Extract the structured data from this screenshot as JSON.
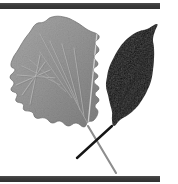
{
  "figure": {
    "kind": "natural-image",
    "width": 178,
    "height": 184,
    "background_color": "#ffffff",
    "caption": "Two leaves arranged with crossing petioles: a gray toothed ovate leaf on the left and a black leaf silhouette on the right, between dark horizontal rules."
  },
  "colors": {
    "background": "#ffffff",
    "rule": "#3b3b3b",
    "rule_highlight": "#565656",
    "gray_leaf_base": "#9a9a9a",
    "gray_leaf_shadow": "#7c7c7c",
    "gray_leaf_light": "#b4b4b4",
    "gray_leaf_vein": "#c9c9c9",
    "gray_leaf_edge": "#6d6d6d",
    "dark_leaf": "#080808",
    "dark_leaf_sheen": "#262626",
    "petiole_gray": "#8d8d8d",
    "petiole_dark": "#151515"
  },
  "rules": {
    "top": {
      "name": "top-rule",
      "x": 0,
      "y": 3,
      "width": 160,
      "height": 6
    },
    "bottom": {
      "name": "bottom-rule",
      "x": 0,
      "y": 176,
      "width": 160,
      "height": 6
    }
  },
  "specimens": [
    {
      "id": "gray-leaf",
      "label": "Gray toothed leaf",
      "position": "left",
      "tone": "mid gray",
      "margin": "serrate",
      "venation": "pinnate",
      "tip_point": [
        97,
        34
      ],
      "base_point": [
        88,
        126
      ],
      "petiole_end": [
        116,
        173
      ],
      "outline": [
        [
          97,
          34
        ],
        [
          88,
          30
        ],
        [
          76,
          22
        ],
        [
          64,
          17
        ],
        [
          52,
          17
        ],
        [
          44,
          22
        ],
        [
          36,
          24
        ],
        [
          30,
          32
        ],
        [
          24,
          40
        ],
        [
          18,
          50
        ],
        [
          13,
          58
        ],
        [
          11,
          66
        ],
        [
          15,
          70
        ],
        [
          10,
          77
        ],
        [
          14,
          83
        ],
        [
          11,
          90
        ],
        [
          17,
          94
        ],
        [
          16,
          101
        ],
        [
          23,
          104
        ],
        [
          24,
          110
        ],
        [
          32,
          112
        ],
        [
          36,
          118
        ],
        [
          45,
          118
        ],
        [
          52,
          123
        ],
        [
          60,
          121
        ],
        [
          68,
          126
        ],
        [
          76,
          123
        ],
        [
          84,
          127
        ],
        [
          88,
          122
        ],
        [
          94,
          120
        ],
        [
          98,
          112
        ],
        [
          95,
          106
        ],
        [
          99,
          100
        ],
        [
          95,
          94
        ],
        [
          99,
          88
        ],
        [
          94,
          82
        ],
        [
          98,
          76
        ],
        [
          93,
          70
        ],
        [
          98,
          64
        ],
        [
          94,
          57
        ],
        [
          99,
          50
        ],
        [
          95,
          43
        ],
        [
          99,
          38
        ]
      ],
      "veins": [
        [
          [
            88,
            124
          ],
          [
            40,
            34
          ]
        ],
        [
          [
            78,
            104
          ],
          [
            50,
            41
          ]
        ],
        [
          [
            72,
            98
          ],
          [
            40,
            52
          ]
        ],
        [
          [
            66,
            92
          ],
          [
            30,
            60
          ]
        ],
        [
          [
            60,
            85
          ],
          [
            22,
            66
          ]
        ],
        [
          [
            55,
            78
          ],
          [
            17,
            75
          ]
        ],
        [
          [
            50,
            70
          ],
          [
            16,
            85
          ]
        ],
        [
          [
            45,
            62
          ],
          [
            22,
            95
          ]
        ],
        [
          [
            40,
            55
          ],
          [
            30,
            104
          ]
        ],
        [
          [
            80,
            110
          ],
          [
            62,
            44
          ]
        ],
        [
          [
            84,
            116
          ],
          [
            74,
            48
          ]
        ]
      ]
    },
    {
      "id": "black-leaf",
      "label": "Black leaf silhouette",
      "position": "right",
      "tone": "near black",
      "margin": "entire",
      "venation": "pinnate, faint",
      "tip_point": [
        157,
        24
      ],
      "base_point": [
        112,
        126
      ],
      "petiole_end": [
        77,
        158
      ],
      "outline": [
        [
          157,
          24
        ],
        [
          147,
          29
        ],
        [
          140,
          31
        ],
        [
          132,
          35
        ],
        [
          124,
          42
        ],
        [
          118,
          50
        ],
        [
          113,
          59
        ],
        [
          109,
          68
        ],
        [
          107,
          77
        ],
        [
          106,
          86
        ],
        [
          108,
          95
        ],
        [
          110,
          104
        ],
        [
          112,
          112
        ],
        [
          112,
          120
        ],
        [
          114,
          126
        ],
        [
          120,
          120
        ],
        [
          128,
          115
        ],
        [
          136,
          108
        ],
        [
          142,
          100
        ],
        [
          147,
          91
        ],
        [
          151,
          81
        ],
        [
          153,
          70
        ],
        [
          154,
          59
        ],
        [
          154,
          48
        ],
        [
          153,
          39
        ],
        [
          155,
          31
        ]
      ],
      "veins": [
        [
          [
            113,
            120
          ],
          [
            151,
            45
          ]
        ],
        [
          [
            120,
            104
          ],
          [
            146,
            62
          ]
        ],
        [
          [
            116,
            92
          ],
          [
            149,
            72
          ]
        ],
        [
          [
            112,
            80
          ],
          [
            145,
            55
          ]
        ],
        [
          [
            124,
            112
          ],
          [
            148,
            80
          ]
        ]
      ]
    }
  ],
  "petioles": [
    {
      "id": "gray-petiole",
      "from": [
        88,
        126
      ],
      "to": [
        116,
        173
      ],
      "color": "#8d8d8d",
      "width": 2.1
    },
    {
      "id": "dark-petiole",
      "from": [
        112,
        126
      ],
      "to": [
        77,
        158
      ],
      "color": "#151515",
      "width": 2.4
    }
  ],
  "crossing_point": [
    96,
    143
  ]
}
